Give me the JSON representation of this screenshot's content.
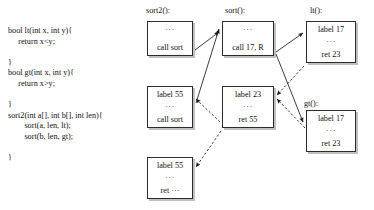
{
  "code": {
    "lines": [
      "bool lt(int x, int y){",
      "     return x<y;",
      "",
      "}",
      "bool gt(int x, int y){",
      "     return x>y;",
      "",
      "}",
      "sort2(int a[], int b[], int len){",
      "        sort(a, len, lt);",
      "        sort(b, len, gt);",
      "",
      "}"
    ]
  },
  "columns": [
    {
      "header": "sort2():"
    },
    {
      "header": "sort():"
    },
    {
      "header": "lt():"
    },
    {
      "header": "gt():"
    }
  ],
  "frames": [
    {
      "id": "sort2-call",
      "column": "sort2():",
      "lines": [
        "···",
        "call sort"
      ]
    },
    {
      "id": "sort2-label55-call",
      "column": "sort2():",
      "lines": [
        "label 55",
        "···",
        "call sort"
      ]
    },
    {
      "id": "sort2-label55-ret",
      "column": "sort2():",
      "lines": [
        "label 55",
        "···",
        "ret ···"
      ]
    },
    {
      "id": "sort-call17",
      "column": "sort():",
      "lines": [
        "···",
        "call 17, R"
      ]
    },
    {
      "id": "sort-label23-ret55",
      "column": "sort():",
      "lines": [
        "label 23",
        "···",
        "ret 55"
      ]
    },
    {
      "id": "lt-label17-ret23",
      "column": "lt():",
      "lines": [
        "label 17",
        "···",
        "ret 23"
      ]
    },
    {
      "id": "gt-label17-ret23",
      "column": "gt():",
      "lines": [
        "label 17",
        "···",
        "ret 23"
      ]
    }
  ],
  "edges": [
    {
      "id": "edge-sort2call-to-sortcall",
      "style": "solid",
      "from": "sort2-call",
      "to": "sort-call17"
    },
    {
      "id": "edge-sortcall-to-lt",
      "style": "solid",
      "from": "sort-call17",
      "to": "lt-label17-ret23"
    },
    {
      "id": "edge-sortcall-to-gt",
      "style": "solid",
      "from": "sort-call17",
      "to": "gt-label17-ret23"
    },
    {
      "id": "edge-lt-to-sortlabel23",
      "style": "dashed",
      "from": "lt-label17-ret23",
      "to": "sort-label23-ret55"
    },
    {
      "id": "edge-gt-to-sortlabel23",
      "style": "dashed",
      "from": "gt-label17-ret23",
      "to": "sort-label23-ret55"
    },
    {
      "id": "edge-sortret55-to-sort2label55call",
      "style": "dashed",
      "from": "sort-label23-ret55",
      "to": "sort2-label55-call"
    },
    {
      "id": "edge-sortret55-to-sort2label55ret",
      "style": "dashed",
      "from": "sort-label23-ret55",
      "to": "sort2-label55-ret"
    },
    {
      "id": "edge-sort2label55call-to-sortcall",
      "style": "solid",
      "from": "sort2-label55-call",
      "to": "sort-call17"
    }
  ],
  "colors": {
    "ink": "#1a1a1a",
    "box_border": "#2b2b2b",
    "box_shadow": "#8c8c8c",
    "background": "#ffffff"
  }
}
